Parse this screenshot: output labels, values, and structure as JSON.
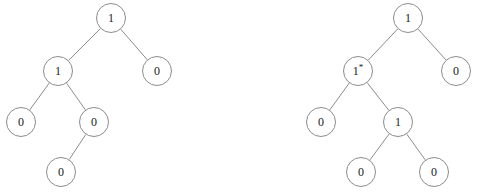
{
  "figure": {
    "width": 478,
    "height": 192,
    "background_color": "#ffffff",
    "stroke_color": "#8c8c8c",
    "text_color": "#1a1a1a",
    "node_radius": 15,
    "caption": ""
  },
  "trees": [
    {
      "name": "left-tree",
      "nodes": [
        {
          "id": "L0",
          "label": "1",
          "x": 111,
          "y": 18,
          "level": 0
        },
        {
          "id": "L1",
          "label": "1",
          "x": 58,
          "y": 71,
          "level": 1
        },
        {
          "id": "L2",
          "label": "0",
          "x": 157,
          "y": 71,
          "level": 1
        },
        {
          "id": "L3",
          "label": "0",
          "x": 21,
          "y": 122,
          "level": 2
        },
        {
          "id": "L4",
          "label": "0",
          "x": 94,
          "y": 122,
          "level": 2
        },
        {
          "id": "L5",
          "label": "0",
          "x": 61,
          "y": 172,
          "level": 3
        }
      ],
      "edges": [
        {
          "from": "L0",
          "to": "L1"
        },
        {
          "from": "L0",
          "to": "L2"
        },
        {
          "from": "L1",
          "to": "L3"
        },
        {
          "from": "L1",
          "to": "L4"
        },
        {
          "from": "L4",
          "to": "L5"
        }
      ]
    },
    {
      "name": "right-tree",
      "nodes": [
        {
          "id": "R0",
          "label": "1",
          "x": 408,
          "y": 18,
          "level": 0
        },
        {
          "id": "R1",
          "label": "1*",
          "x": 358,
          "y": 71,
          "level": 1
        },
        {
          "id": "R2",
          "label": "0",
          "x": 456,
          "y": 71,
          "level": 1
        },
        {
          "id": "R3",
          "label": "0",
          "x": 321,
          "y": 122,
          "level": 2
        },
        {
          "id": "R4",
          "label": "1",
          "x": 398,
          "y": 122,
          "level": 2
        },
        {
          "id": "R5",
          "label": "0",
          "x": 361,
          "y": 172,
          "level": 3
        },
        {
          "id": "R6",
          "label": "0",
          "x": 434,
          "y": 172,
          "level": 3
        }
      ],
      "edges": [
        {
          "from": "R0",
          "to": "R1"
        },
        {
          "from": "R0",
          "to": "R2"
        },
        {
          "from": "R1",
          "to": "R3"
        },
        {
          "from": "R1",
          "to": "R4"
        },
        {
          "from": "R4",
          "to": "R5"
        },
        {
          "from": "R4",
          "to": "R6"
        }
      ]
    }
  ]
}
